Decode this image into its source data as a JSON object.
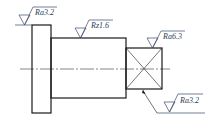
{
  "drawing": {
    "type": "shaft-surface-roughness",
    "annotations": [
      {
        "id": "flange-face",
        "label": "Ra3.2"
      },
      {
        "id": "shaft-body",
        "label": "Rz1.6"
      },
      {
        "id": "square-end",
        "label": "Ra6.3"
      },
      {
        "id": "square-bottom",
        "label": "Ra3.2"
      }
    ]
  },
  "colors": {
    "outline": "#1a1a1a",
    "symbol": "#3a4a6a",
    "text": "#2a3a5a"
  }
}
